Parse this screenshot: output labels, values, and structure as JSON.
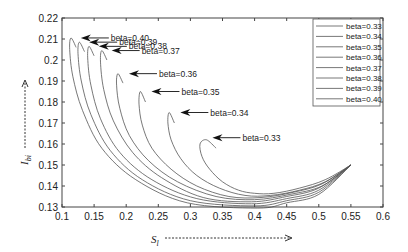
{
  "chart_data": {
    "type": "line",
    "title": "",
    "xlabel": "S_l",
    "ylabel": "I_bi",
    "xlim": [
      0.1,
      0.6
    ],
    "ylim": [
      0.13,
      0.22
    ],
    "xticks": [
      "0.1",
      "0.15",
      "0.2",
      "0.25",
      "0.3",
      "0.35",
      "0.4",
      "0.45",
      "0.5",
      "0.55",
      "0.6"
    ],
    "yticks": [
      "0.13",
      "0.14",
      "0.15",
      "0.16",
      "0.17",
      "0.18",
      "0.19",
      "0.2",
      "0.21",
      "0.22"
    ],
    "grid": false,
    "legend_position": "upper right",
    "series": [
      {
        "name": "beta=0.33",
        "x": [
          0.34,
          0.325,
          0.315,
          0.318,
          0.33,
          0.35,
          0.375,
          0.4,
          0.43,
          0.47,
          0.51,
          0.55
        ],
        "y": [
          0.158,
          0.162,
          0.16,
          0.154,
          0.148,
          0.142,
          0.138,
          0.1365,
          0.1365,
          0.139,
          0.143,
          0.15
        ]
      },
      {
        "name": "beta=0.34",
        "x": [
          0.275,
          0.267,
          0.265,
          0.27,
          0.285,
          0.31,
          0.345,
          0.385,
          0.425,
          0.47,
          0.51,
          0.55
        ],
        "y": [
          0.17,
          0.175,
          0.17,
          0.162,
          0.153,
          0.145,
          0.139,
          0.1355,
          0.1355,
          0.138,
          0.142,
          0.15
        ]
      },
      {
        "name": "beta=0.35",
        "x": [
          0.23,
          0.222,
          0.22,
          0.225,
          0.24,
          0.27,
          0.31,
          0.36,
          0.41,
          0.46,
          0.505,
          0.55
        ],
        "y": [
          0.18,
          0.185,
          0.179,
          0.169,
          0.158,
          0.148,
          0.14,
          0.135,
          0.1345,
          0.137,
          0.141,
          0.15
        ]
      },
      {
        "name": "beta=0.36",
        "x": [
          0.195,
          0.187,
          0.185,
          0.19,
          0.205,
          0.235,
          0.28,
          0.34,
          0.4,
          0.455,
          0.505,
          0.55
        ],
        "y": [
          0.189,
          0.1935,
          0.188,
          0.177,
          0.164,
          0.152,
          0.142,
          0.135,
          0.1335,
          0.136,
          0.14,
          0.15
        ]
      },
      {
        "name": "beta=0.37",
        "x": [
          0.17,
          0.162,
          0.16,
          0.165,
          0.18,
          0.21,
          0.255,
          0.32,
          0.395,
          0.45,
          0.5,
          0.55
        ],
        "y": [
          0.2,
          0.2045,
          0.199,
          0.186,
          0.171,
          0.156,
          0.144,
          0.1345,
          0.1325,
          0.135,
          0.139,
          0.15
        ]
      },
      {
        "name": "beta=0.38",
        "x": [
          0.15,
          0.142,
          0.14,
          0.145,
          0.16,
          0.19,
          0.24,
          0.31,
          0.395,
          0.45,
          0.5,
          0.55
        ],
        "y": [
          0.202,
          0.2065,
          0.201,
          0.188,
          0.172,
          0.156,
          0.143,
          0.134,
          0.1315,
          0.134,
          0.138,
          0.15
        ]
      },
      {
        "name": "beta=0.39",
        "x": [
          0.135,
          0.127,
          0.125,
          0.13,
          0.145,
          0.175,
          0.225,
          0.3,
          0.4,
          0.45,
          0.5,
          0.55
        ],
        "y": [
          0.204,
          0.2085,
          0.203,
          0.19,
          0.174,
          0.157,
          0.143,
          0.133,
          0.1305,
          0.133,
          0.137,
          0.15
        ]
      },
      {
        "name": "beta=0.40",
        "x": [
          0.122,
          0.114,
          0.112,
          0.117,
          0.132,
          0.162,
          0.215,
          0.295,
          0.405,
          0.45,
          0.5,
          0.55
        ],
        "y": [
          0.206,
          0.2105,
          0.205,
          0.192,
          0.176,
          0.158,
          0.143,
          0.132,
          0.1295,
          0.132,
          0.136,
          0.15
        ]
      }
    ],
    "annotations": [
      {
        "text": "beta=0.40",
        "arrow_to": [
          0.12,
          0.2105
        ]
      },
      {
        "text": "beta=0.39",
        "arrow_to": [
          0.133,
          0.2085
        ]
      },
      {
        "text": "beta=0.38",
        "arrow_to": [
          0.148,
          0.2065
        ]
      },
      {
        "text": "beta=0.37",
        "arrow_to": [
          0.168,
          0.2045
        ]
      },
      {
        "text": "beta=0.36",
        "arrow_to": [
          0.195,
          0.1935
        ]
      },
      {
        "text": "beta=0.35",
        "arrow_to": [
          0.23,
          0.185
        ]
      },
      {
        "text": "beta=0.34",
        "arrow_to": [
          0.275,
          0.175
        ]
      },
      {
        "text": "beta=0.33",
        "arrow_to": [
          0.325,
          0.163
        ]
      }
    ],
    "line_color": "#555555"
  },
  "axes": {
    "xlabel_main": "S",
    "xlabel_sub": "l",
    "ylabel_main": "I",
    "ylabel_sub": "bi"
  }
}
